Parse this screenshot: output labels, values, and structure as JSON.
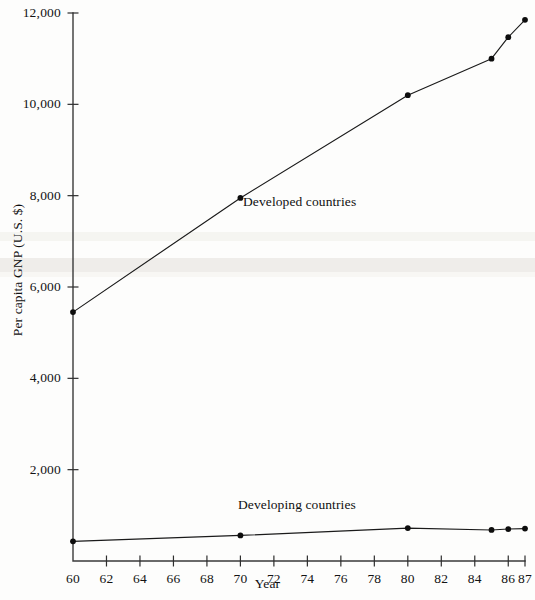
{
  "chart_data": {
    "type": "line",
    "title": "",
    "xlabel": "Year",
    "ylabel": "Per capita GNP (U.S. $)",
    "xlim": [
      60,
      87
    ],
    "ylim": [
      0,
      12000
    ],
    "grid": false,
    "legend_position": "inline-annotation",
    "x_tick_labels": [
      "60",
      "62",
      "64",
      "66",
      "68",
      "70",
      "72",
      "74",
      "76",
      "78",
      "80",
      "82",
      "84",
      "86",
      "87"
    ],
    "x_tick_values": [
      60,
      62,
      64,
      66,
      68,
      70,
      72,
      74,
      76,
      78,
      80,
      82,
      84,
      86,
      87
    ],
    "y_tick_labels": [
      "2,000",
      "4,000",
      "6,000",
      "8,000",
      "10,000",
      "12,000"
    ],
    "y_tick_values": [
      2000,
      4000,
      6000,
      8000,
      10000,
      12000
    ],
    "series": [
      {
        "name": "Developed countries",
        "color": "#101010",
        "x": [
          60,
          70,
          80,
          85,
          86,
          87
        ],
        "values": [
          5450,
          7950,
          10200,
          11000,
          11470,
          11850
        ]
      },
      {
        "name": "Developing countries",
        "color": "#101010",
        "x": [
          60,
          70,
          80,
          85,
          86,
          87
        ],
        "values": [
          430,
          560,
          720,
          680,
          700,
          710
        ]
      }
    ],
    "annotations": [
      {
        "text": "Developed countries",
        "x": 72.5,
        "y": 7850
      },
      {
        "text": "Developing countries",
        "x": 72.0,
        "y": 1450
      }
    ]
  },
  "axes": {
    "y_title": "Per capita GNP (U.S. $)",
    "x_title": "Year"
  }
}
